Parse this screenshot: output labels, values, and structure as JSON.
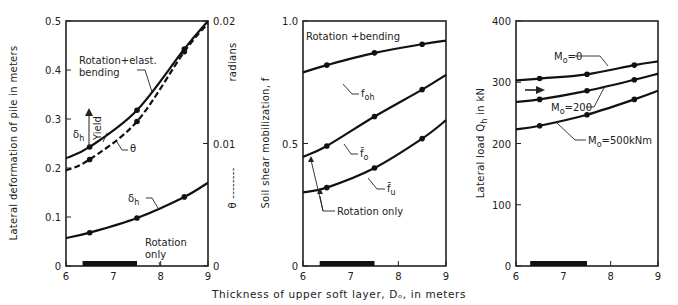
{
  "figure": {
    "shared_xlabel": "Thickness of upper soft layer, Dₒ, in meters"
  },
  "chart_data": [
    {
      "type": "line",
      "panel": "left",
      "title": "",
      "xlabel": "Thickness of upper soft layer, Do, in meters",
      "ylabel": "Lateral deformation of pile in meters",
      "y2label": "radians",
      "y2legend": "θ ------",
      "xlim": [
        6,
        9
      ],
      "ylim": [
        0,
        0.5
      ],
      "y2lim": [
        0,
        0.02
      ],
      "xticks": [
        6,
        7,
        8,
        9
      ],
      "yticks": [
        0,
        0.1,
        0.2,
        0.3,
        0.4,
        0.5
      ],
      "yticklabels": [
        "0",
        "0.1",
        "0.2",
        "0.3",
        "0.4",
        "0.5"
      ],
      "y2ticks": [
        0,
        0.01,
        0.02
      ],
      "y2ticklabels": [
        "0",
        "0.01",
        "0.02"
      ],
      "grid": false,
      "x": [
        6,
        6.5,
        7.5,
        8.5,
        9
      ],
      "markers_x": [
        6.5,
        7.5,
        8.5
      ],
      "series": [
        {
          "name": "δh (Rotation+elast. bending)",
          "axis": "y",
          "style": "solid",
          "values": [
            0.22,
            0.243,
            0.318,
            0.443,
            0.5
          ]
        },
        {
          "name": "θ (Rotation+elast. bending)",
          "axis": "y2",
          "style": "dashed",
          "values": [
            0.0078,
            0.0087,
            0.0118,
            0.0175,
            0.0198
          ]
        },
        {
          "name": "δh (Rotation only)",
          "axis": "y",
          "style": "solid",
          "values": [
            0.057,
            0.068,
            0.098,
            0.141,
            0.17
          ]
        }
      ],
      "annotations": [
        "Rotation+elast. bending",
        "Yield",
        "δh",
        "θ",
        "δh",
        "Rotation only"
      ],
      "shaded_range_x": [
        6.35,
        7.5
      ]
    },
    {
      "type": "line",
      "panel": "middle",
      "title": "",
      "xlabel": "Thickness of upper soft layer, Do, in meters",
      "ylabel": "Soil shear mobilization, f",
      "xlim": [
        6,
        9
      ],
      "ylim": [
        0,
        1.0
      ],
      "xticks": [
        6,
        7,
        8,
        9
      ],
      "yticks": [
        0,
        0.5,
        1.0
      ],
      "yticklabels": [
        "0",
        "0.5",
        "1.0"
      ],
      "grid": false,
      "x": [
        6,
        6.5,
        7.5,
        8.5,
        9
      ],
      "markers_x": [
        6.5,
        7.5,
        8.5
      ],
      "series": [
        {
          "name": "f_oh",
          "values": [
            0.79,
            0.82,
            0.87,
            0.905,
            0.92
          ]
        },
        {
          "name": "f̄o",
          "values": [
            0.445,
            0.49,
            0.61,
            0.72,
            0.78
          ]
        },
        {
          "name": "f̄u",
          "values": [
            0.3,
            0.32,
            0.4,
            0.52,
            0.595
          ]
        }
      ],
      "annotations": [
        "Rotation +bending",
        "foh",
        "f̄o",
        "f̄u",
        "Rotation only"
      ],
      "shaded_range_x": [
        6.35,
        7.5
      ]
    },
    {
      "type": "line",
      "panel": "right",
      "title": "",
      "xlabel": "Thickness of upper soft layer, Do, in meters",
      "ylabel": "Lateral load Qh in kN",
      "xlim": [
        6,
        9
      ],
      "ylim": [
        0,
        400
      ],
      "xticks": [
        6,
        7,
        8,
        9
      ],
      "yticks": [
        0,
        100,
        200,
        300,
        400
      ],
      "yticklabels": [
        "0",
        "100",
        "200",
        "300",
        "400"
      ],
      "grid": false,
      "x": [
        6,
        6.5,
        7.5,
        8.5,
        9
      ],
      "markers_x": [
        6.5,
        7.5,
        8.5
      ],
      "series": [
        {
          "name": "Mo=0",
          "values": [
            303,
            306,
            313,
            328,
            334
          ]
        },
        {
          "name": "Mo=200",
          "values": [
            268,
            272,
            286,
            304,
            314
          ]
        },
        {
          "name": "Mo=500kNm",
          "values": [
            223,
            229,
            247,
            272,
            286
          ]
        }
      ],
      "annotations": [
        "Mo=0",
        "Mo=200",
        "Mo=500kNm",
        "→"
      ],
      "shaded_range_x": [
        6.3,
        7.5
      ]
    }
  ],
  "labels": {
    "p1": {
      "ylabel": "Lateral deformation of pile in meters",
      "y2label": "radians",
      "y2legend": "θ --------",
      "curve_a": "Rotation+elast.",
      "curve_a2": "bending",
      "yield": "Yield",
      "delta": "δ",
      "delta_sub": "h",
      "theta": "θ",
      "rot_only_1": "Rotation",
      "rot_only_2": "only"
    },
    "p2": {
      "ylabel": "Soil shear mobilization, f",
      "top": "Rotation  +bending",
      "foh": "f",
      "foh_sub": "oh",
      "fo": "f̄",
      "fo_sub": "o",
      "fu": "f̄",
      "fu_sub": "u",
      "rot_only": "Rotation only"
    },
    "p3": {
      "ylabel_a": "Lateral load Q",
      "ylabel_sub": "h",
      "ylabel_b": " in kN",
      "m0": "M",
      "m0_sub": "o",
      "m0_val": "=0",
      "m200_val": "=200",
      "m500_val": "=500kNm"
    }
  }
}
